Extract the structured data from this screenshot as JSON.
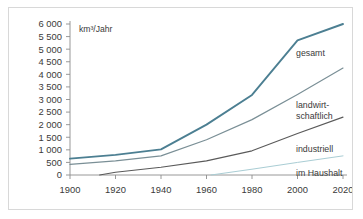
{
  "chart_data": {
    "type": "line",
    "title": "",
    "subtitle": "",
    "unit_label": "km³/Jahr",
    "xlabel": "",
    "ylabel": "",
    "xlim": [
      1900,
      2020
    ],
    "ylim": [
      0,
      6000
    ],
    "grid": false,
    "legend_position": "inline-right-end",
    "x_ticks": [
      1900,
      1920,
      1940,
      1960,
      1980,
      2000,
      2020
    ],
    "x_tick_labels": [
      "1900",
      "1920",
      "1940",
      "1960",
      "1980",
      "2000",
      "2020"
    ],
    "y_ticks": [
      0,
      500,
      1000,
      1500,
      2000,
      2500,
      3000,
      3500,
      4000,
      4500,
      5000,
      5500,
      6000
    ],
    "y_tick_labels": [
      "0",
      "500",
      "1 000",
      "1 500",
      "2 000",
      "2 500",
      "3 000",
      "3 500",
      "4 000",
      "4 500",
      "5 000",
      "5 500",
      "6 000"
    ],
    "series": [
      {
        "name": "gesamt",
        "label": "gesamt",
        "label_lines": [
          "gesamt"
        ],
        "color": "#4c7f92",
        "width": 1.9,
        "x": [
          1900,
          1920,
          1940,
          1960,
          1980,
          2000,
          2020
        ],
        "values": [
          650,
          800,
          1020,
          2000,
          3180,
          5350,
          6000
        ]
      },
      {
        "name": "landwirtschaftlich",
        "label": "landwirtschaftlich",
        "label_lines": [
          "landwirt-",
          "schaftlich"
        ],
        "color": "#7a8f96",
        "width": 1.2,
        "x": [
          1900,
          1920,
          1940,
          1960,
          1980,
          2000,
          2020
        ],
        "values": [
          420,
          560,
          760,
          1400,
          2200,
          3200,
          4250
        ]
      },
      {
        "name": "industriell",
        "label": "industriell",
        "label_lines": [
          "industriell"
        ],
        "color": "#5a5a5a",
        "width": 1.1,
        "x": [
          1913,
          1920,
          1940,
          1960,
          1980,
          2000,
          2020
        ],
        "values": [
          0,
          110,
          310,
          560,
          960,
          1650,
          2300
        ]
      },
      {
        "name": "im Haushalt",
        "label": "im Haushalt",
        "label_lines": [
          "im Haushalt"
        ],
        "color": "#a9cdd4",
        "width": 1.0,
        "x": [
          1962,
          1980,
          2000,
          2020
        ],
        "values": [
          0,
          230,
          500,
          760
        ]
      }
    ],
    "colors": {
      "axis": "#8d8d8d",
      "text": "#3a3a3a",
      "border": "#d8d8d8",
      "background": "#ffffff"
    }
  }
}
